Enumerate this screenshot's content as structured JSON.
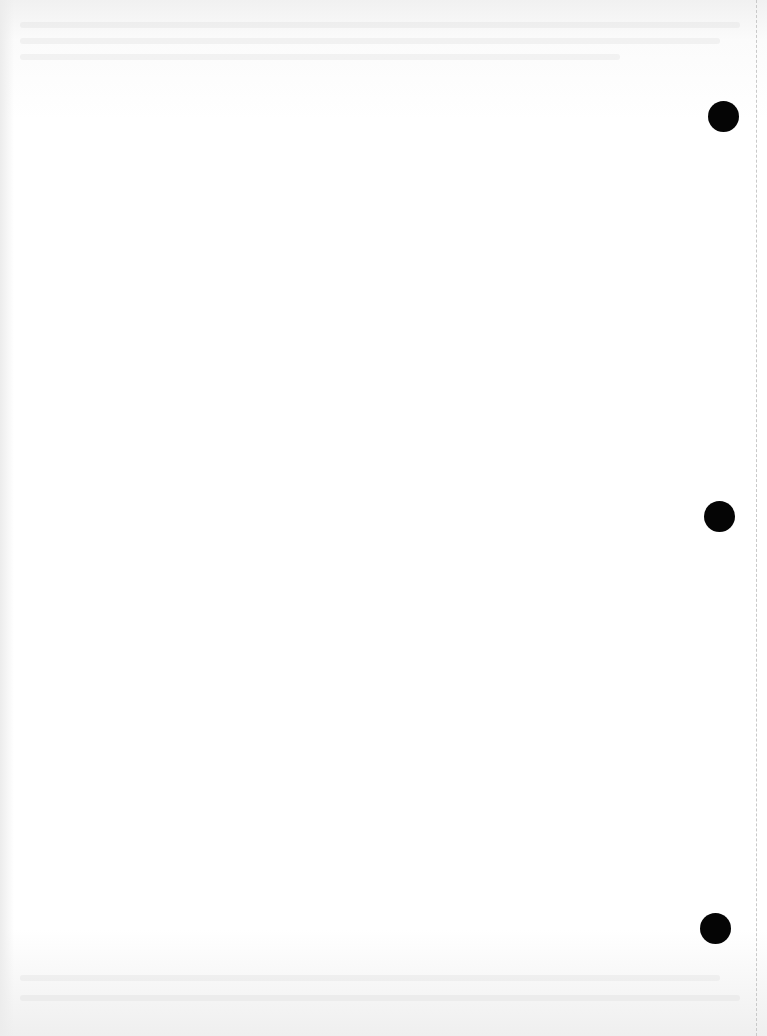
{
  "document": {
    "type": "blank scanned page",
    "punch_holes": [
      {
        "cx": 723,
        "cy": 117
      },
      {
        "cx": 719,
        "cy": 517
      },
      {
        "cx": 715,
        "cy": 929
      }
    ],
    "colors": {
      "paper": "#ffffff",
      "hole": "#050505",
      "perforation": "#c9c9c9"
    }
  }
}
